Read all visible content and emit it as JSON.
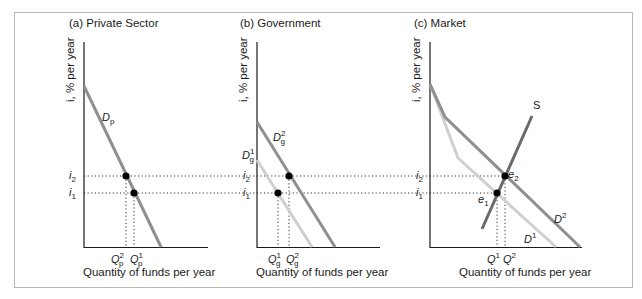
{
  "panels": [
    {
      "id": "a",
      "title": "(a) Private Sector",
      "ylabel": "i, % per year",
      "xlabel": "Quantity of funds per year",
      "curves": [
        {
          "name": "D_p",
          "label_base": "D",
          "label_sub": "p"
        }
      ],
      "rate_labels": {
        "i2_base": "i",
        "i2_sub": "2",
        "i1_base": "i",
        "i1_sub": "1"
      },
      "q_labels": [
        {
          "base": "Q",
          "sup": "2",
          "sub": "p"
        },
        {
          "base": "Q",
          "sup": "1",
          "sub": "p"
        }
      ]
    },
    {
      "id": "b",
      "title": "(b) Government",
      "ylabel": "i, % per year",
      "xlabel": "Quantity of funds per year",
      "curves": [
        {
          "name": "D_g^2",
          "label_base": "D",
          "label_sup": "2",
          "label_sub": "g"
        },
        {
          "name": "D_g^1",
          "label_base": "D",
          "label_sup": "1",
          "label_sub": "g"
        }
      ],
      "rate_labels": {
        "i2_base": "i",
        "i2_sub": "2",
        "i1_base": "i",
        "i1_sub": "1"
      },
      "q_labels": [
        {
          "base": "Q",
          "sup": "1",
          "sub": "g"
        },
        {
          "base": "Q",
          "sup": "2",
          "sub": "g"
        }
      ]
    },
    {
      "id": "c",
      "title": "(c) Market",
      "ylabel": "i, % per year",
      "xlabel": "Quantity of funds per year",
      "curves": [
        {
          "name": "S",
          "label_base": "S"
        },
        {
          "name": "D^2",
          "label_base": "D",
          "label_sup": "2"
        },
        {
          "name": "D^1",
          "label_base": "D",
          "label_sup": "1"
        }
      ],
      "rate_labels": {
        "i2_base": "i",
        "i2_sub": "2",
        "i1_base": "i",
        "i1_sub": "1"
      },
      "equilibria": [
        {
          "base": "e",
          "sub": "2"
        },
        {
          "base": "e",
          "sub": "1"
        }
      ],
      "q_labels": [
        {
          "base": "Q",
          "sup": "1"
        },
        {
          "base": "Q",
          "sup": "2"
        }
      ]
    }
  ],
  "colors": {
    "axis": "#1a1a1a",
    "demand_dark": "#8f8f8f",
    "demand_light": "#cfcfcf",
    "supply": "#6a6a6a",
    "point": "#000000",
    "frame": "#b9b9b9"
  }
}
